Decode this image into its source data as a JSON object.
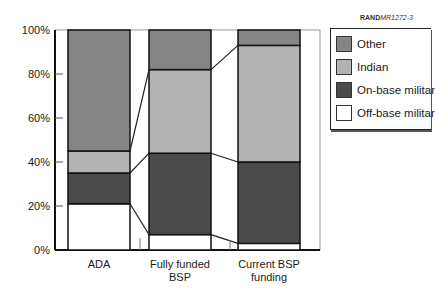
{
  "chart_data": {
    "type": "bar",
    "stacked": true,
    "percent": true,
    "title": "",
    "xlabel": "",
    "ylabel": "",
    "ylim": [
      0,
      100
    ],
    "yticks": [
      "0%",
      "20%",
      "40%",
      "60%",
      "80%",
      "100%"
    ],
    "categories": [
      "ADA",
      "Fully funded BSP",
      "Current BSP funding"
    ],
    "category_lines": [
      [
        "ADA"
      ],
      [
        "Fully funded",
        "BSP"
      ],
      [
        "Current BSP",
        "funding"
      ]
    ],
    "series": [
      {
        "name": "Off-base military",
        "color": "#ffffff",
        "values": [
          21,
          7,
          3
        ]
      },
      {
        "name": "On-base military",
        "color": "#4a4a4a",
        "values": [
          14,
          37,
          37
        ]
      },
      {
        "name": "Indian",
        "color": "#b2b2b2",
        "values": [
          10,
          38,
          53
        ]
      },
      {
        "name": "Other",
        "color": "#858585",
        "values": [
          55,
          18,
          7
        ]
      }
    ],
    "legend_position": "upper right",
    "grid": false,
    "connector_lines": true
  },
  "legend": {
    "items": [
      {
        "label": "Other",
        "color": "#858585"
      },
      {
        "label": "Indian",
        "color": "#b2b2b2"
      },
      {
        "label": "On-base militar",
        "color": "#4a4a4a"
      },
      {
        "label": "Off-base militar",
        "color": "#ffffff"
      }
    ]
  },
  "source": {
    "brand": "RAND",
    "code": "MR1272-3"
  }
}
